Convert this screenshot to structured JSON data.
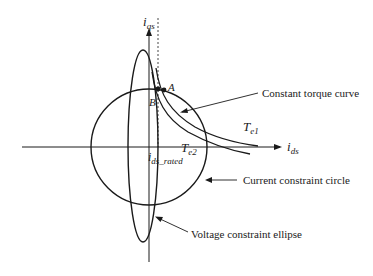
{
  "diagram": {
    "axes": {
      "vertical_label": "i",
      "vertical_sub": "qs",
      "horizontal_label": "i",
      "horizontal_sub": "ds",
      "rated_label": "i",
      "rated_sub": "ds_rated"
    },
    "points": {
      "a_label": "A",
      "b_label": "B"
    },
    "curves": {
      "te1_label": "T",
      "te1_sub": "e1",
      "te2_label": "T",
      "te2_sub": "e2"
    },
    "annotations": {
      "torque_curve": "Constant torque curve",
      "current_circle": "Current constraint circle",
      "voltage_ellipse": "Voltage constraint ellipse"
    },
    "colors": {
      "stroke": "#1a1a1a",
      "background": "#ffffff"
    }
  }
}
